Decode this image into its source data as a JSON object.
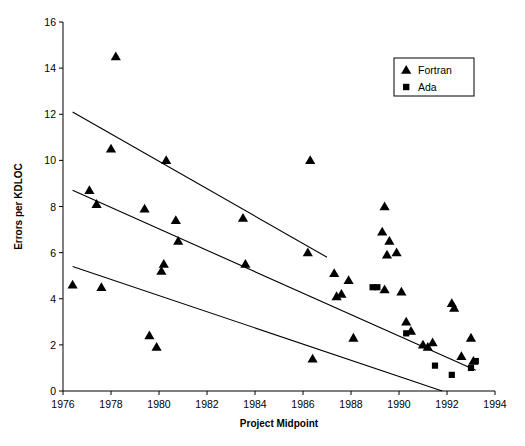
{
  "chart_data": {
    "type": "scatter",
    "title": "",
    "xlabel": "Project Midpoint",
    "ylabel": "Errors per KDLOC",
    "xlim": [
      1976,
      1994
    ],
    "ylim": [
      0,
      16
    ],
    "xticks": [
      1976,
      1978,
      1980,
      1982,
      1984,
      1986,
      1988,
      1990,
      1992,
      1994
    ],
    "yticks": [
      0,
      2,
      4,
      6,
      8,
      10,
      12,
      14,
      16
    ],
    "grid": false,
    "legend_position": "top-right",
    "legend": [
      {
        "name": "Fortran",
        "marker": "triangle"
      },
      {
        "name": "Ada",
        "marker": "square"
      }
    ],
    "series": [
      {
        "name": "Fortran",
        "marker": "triangle",
        "points": [
          [
            1976.4,
            4.6
          ],
          [
            1977.1,
            8.7
          ],
          [
            1977.4,
            8.1
          ],
          [
            1977.6,
            4.5
          ],
          [
            1978.2,
            14.5
          ],
          [
            1978.0,
            10.5
          ],
          [
            1979.4,
            7.9
          ],
          [
            1979.6,
            2.4
          ],
          [
            1979.9,
            1.9
          ],
          [
            1980.3,
            10.0
          ],
          [
            1980.2,
            5.5
          ],
          [
            1980.1,
            5.2
          ],
          [
            1980.7,
            7.4
          ],
          [
            1980.8,
            6.5
          ],
          [
            1983.5,
            7.5
          ],
          [
            1983.6,
            5.5
          ],
          [
            1986.3,
            10.0
          ],
          [
            1986.2,
            6.0
          ],
          [
            1986.4,
            1.4
          ],
          [
            1987.3,
            5.1
          ],
          [
            1987.4,
            4.1
          ],
          [
            1987.6,
            4.2
          ],
          [
            1987.9,
            4.8
          ],
          [
            1988.1,
            2.3
          ],
          [
            1989.4,
            8.0
          ],
          [
            1989.3,
            6.9
          ],
          [
            1989.6,
            6.5
          ],
          [
            1989.9,
            6.0
          ],
          [
            1989.5,
            5.9
          ],
          [
            1989.4,
            4.4
          ],
          [
            1990.1,
            4.3
          ],
          [
            1990.3,
            3.0
          ],
          [
            1990.5,
            2.6
          ],
          [
            1991.0,
            2.0
          ],
          [
            1991.2,
            1.9
          ],
          [
            1991.4,
            2.1
          ],
          [
            1992.2,
            3.8
          ],
          [
            1992.3,
            3.6
          ],
          [
            1992.6,
            1.5
          ],
          [
            1993.0,
            2.3
          ],
          [
            1993.1,
            1.3
          ]
        ]
      },
      {
        "name": "Ada",
        "marker": "square",
        "points": [
          [
            1988.9,
            4.5
          ],
          [
            1989.1,
            4.5
          ],
          [
            1990.3,
            2.5
          ],
          [
            1991.5,
            1.1
          ],
          [
            1992.2,
            0.7
          ],
          [
            1993.0,
            1.0
          ],
          [
            1993.2,
            1.3
          ]
        ]
      }
    ],
    "trend_lines": [
      {
        "name": "upper",
        "x1": 1976.4,
        "y1": 12.1,
        "x2": 1987.0,
        "y2": 5.8
      },
      {
        "name": "middle",
        "x1": 1976.4,
        "y1": 8.7,
        "x2": 1993.2,
        "y2": 0.9
      },
      {
        "name": "lower",
        "x1": 1976.4,
        "y1": 5.4,
        "x2": 1991.8,
        "y2": 0.0
      }
    ]
  }
}
